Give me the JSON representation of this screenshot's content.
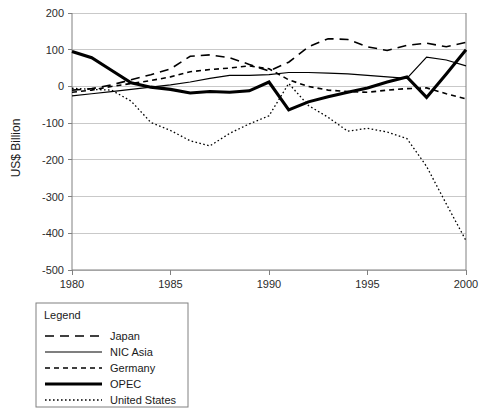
{
  "chart_data": {
    "type": "line",
    "title": "",
    "xlabel": "",
    "ylabel": "US$ Billion",
    "xlim": [
      1980,
      2000
    ],
    "ylim": [
      -500,
      200
    ],
    "grid": true,
    "x": [
      1980,
      1981,
      1982,
      1983,
      1984,
      1985,
      1986,
      1987,
      1988,
      1989,
      1990,
      1991,
      1992,
      1993,
      1994,
      1995,
      1996,
      1997,
      1998,
      1999,
      2000
    ],
    "xticks": [
      "1980",
      "1985",
      "1990",
      "1995",
      "2000"
    ],
    "xtick_values": [
      1980,
      1985,
      1990,
      1995,
      2000
    ],
    "yticks": [
      "200",
      "100",
      "0",
      "-100",
      "-200",
      "-300",
      "-400",
      "-500"
    ],
    "ytick_values": [
      200,
      100,
      0,
      -100,
      -200,
      -300,
      -400,
      -500
    ],
    "legend_position": "below-left",
    "series": [
      {
        "name": "Japan",
        "style": "long-dash",
        "values": [
          -10,
          -6,
          4,
          18,
          32,
          48,
          82,
          86,
          78,
          60,
          42,
          66,
          108,
          130,
          128,
          108,
          98,
          112,
          118,
          108,
          120
        ]
      },
      {
        "name": "NIC Asia",
        "style": "solid-thin",
        "values": [
          -26,
          -20,
          -14,
          -8,
          -2,
          4,
          12,
          22,
          30,
          30,
          32,
          38,
          38,
          36,
          34,
          30,
          26,
          22,
          80,
          72,
          56
        ]
      },
      {
        "name": "Germany",
        "style": "short-dash",
        "values": [
          -16,
          -10,
          0,
          8,
          16,
          26,
          40,
          46,
          50,
          56,
          48,
          18,
          0,
          -10,
          -14,
          -16,
          -10,
          -6,
          -4,
          -20,
          -34
        ]
      },
      {
        "name": "OPEC",
        "style": "solid-thick",
        "values": [
          95,
          78,
          44,
          10,
          -2,
          -8,
          -18,
          -14,
          -16,
          -12,
          12,
          -64,
          -42,
          -28,
          -16,
          -4,
          12,
          26,
          -30,
          34,
          100
        ]
      },
      {
        "name": "United States",
        "style": "dotted",
        "values": [
          -5,
          -8,
          -10,
          -40,
          -98,
          -120,
          -148,
          -162,
          -128,
          -102,
          -80,
          8,
          -52,
          -84,
          -122,
          -114,
          -124,
          -142,
          -218,
          -320,
          -420
        ]
      }
    ]
  },
  "axis": {
    "y_title": "US$ Billion"
  },
  "legend": {
    "title": "Legend",
    "items": [
      {
        "label": "Japan",
        "style": "long-dash"
      },
      {
        "label": "NIC Asia",
        "style": "solid-thin"
      },
      {
        "label": "Germany",
        "style": "short-dash"
      },
      {
        "label": "OPEC",
        "style": "solid-thick"
      },
      {
        "label": "United States",
        "style": "dotted"
      }
    ]
  }
}
